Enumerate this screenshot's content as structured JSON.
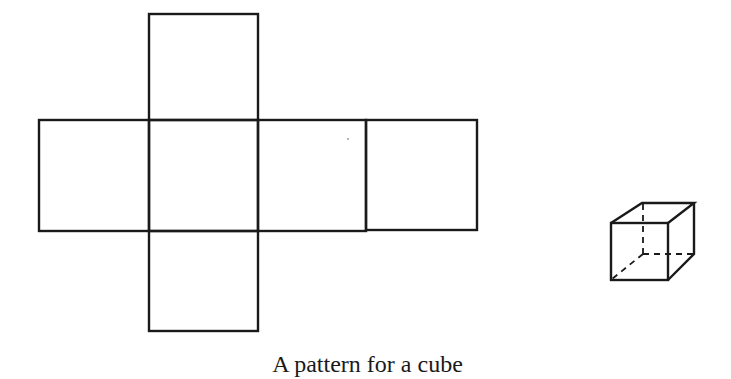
{
  "caption": "A pattern for a cube",
  "colors": {
    "stroke": "#1a1a1a",
    "background": "#ffffff"
  },
  "net": {
    "faces": [
      {
        "name": "top",
        "x": 149,
        "y": 14,
        "w": 109,
        "h": 106
      },
      {
        "name": "left",
        "x": 39,
        "y": 120,
        "w": 110,
        "h": 111
      },
      {
        "name": "center",
        "x": 149,
        "y": 120,
        "w": 109,
        "h": 111
      },
      {
        "name": "right",
        "x": 258,
        "y": 120,
        "w": 108,
        "h": 111
      },
      {
        "name": "far-right",
        "x": 366,
        "y": 120,
        "w": 111,
        "h": 110
      },
      {
        "name": "bottom",
        "x": 149,
        "y": 231,
        "w": 109,
        "h": 100
      }
    ]
  },
  "cube_3d": {
    "description": "assembled cube in perspective with hidden edges dashed"
  }
}
